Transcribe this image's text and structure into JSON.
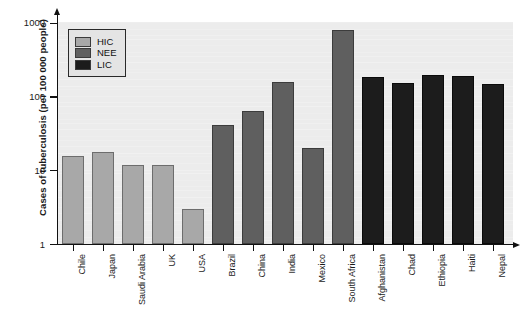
{
  "chart_data": {
    "type": "bar",
    "title": "",
    "xlabel": "",
    "ylabel": "Cases of tuberculosis (per 100 000 people)",
    "yscale": "log",
    "ylim": [
      1,
      1000
    ],
    "yticks": [
      1,
      10,
      100,
      1000
    ],
    "ytick_labels": [
      "1",
      "10",
      "100",
      "1000"
    ],
    "grid": false,
    "legend_position": "upper-left",
    "legend": [
      {
        "key": "hic",
        "label": "HIC",
        "color": "#a8a8a8"
      },
      {
        "key": "nee",
        "label": "NEE",
        "color": "#5f5f5f"
      },
      {
        "key": "lic",
        "label": "LIC",
        "color": "#1c1c1c"
      }
    ],
    "categories": [
      "Chile",
      "Japan",
      "Saudi Arabia",
      "UK",
      "USA",
      "Brazil",
      "China",
      "India",
      "Mexico",
      "South Africa",
      "Afghanistan",
      "Chad",
      "Ethiopia",
      "Haiti",
      "Nepal"
    ],
    "values": [
      16,
      18,
      12,
      12,
      3,
      42,
      65,
      160,
      20,
      800,
      185,
      155,
      200,
      190,
      150
    ],
    "groups": [
      "hic",
      "hic",
      "hic",
      "hic",
      "hic",
      "nee",
      "nee",
      "nee",
      "nee",
      "nee",
      "lic",
      "lic",
      "lic",
      "lic",
      "lic"
    ]
  }
}
